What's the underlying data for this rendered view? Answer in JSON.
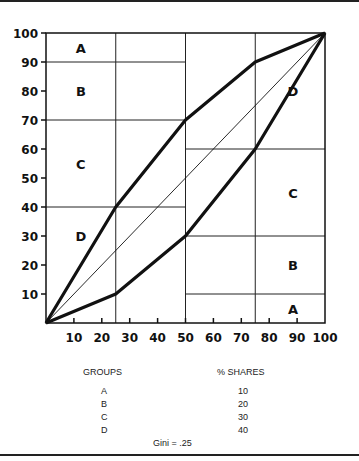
{
  "chart_data": {
    "type": "line",
    "title": "",
    "xlabel": "",
    "ylabel": "",
    "xlim": [
      0,
      100
    ],
    "ylim": [
      0,
      100
    ],
    "x_ticks": [
      "10",
      "20",
      "30",
      "40",
      "50",
      "60",
      "70",
      "80",
      "90",
      "100"
    ],
    "y_ticks": [
      "10",
      "20",
      "30",
      "40",
      "50",
      "60",
      "70",
      "80",
      "90",
      "100"
    ],
    "grid": {
      "x": [
        25,
        50,
        75
      ],
      "y_left": [
        40,
        70,
        90
      ],
      "y_right": [
        10,
        30,
        60
      ]
    },
    "series": [
      {
        "name": "upper-lorenz",
        "x": [
          0,
          25,
          50,
          75,
          100
        ],
        "y": [
          0,
          40,
          70,
          90,
          100
        ]
      },
      {
        "name": "equality-line",
        "x": [
          0,
          100
        ],
        "y": [
          0,
          100
        ]
      },
      {
        "name": "lower-lorenz",
        "x": [
          0,
          25,
          50,
          75,
          100
        ],
        "y": [
          0,
          10,
          30,
          60,
          100
        ]
      }
    ],
    "region_labels_left": [
      {
        "label": "A",
        "y": 95
      },
      {
        "label": "B",
        "y": 80
      },
      {
        "label": "C",
        "y": 55
      },
      {
        "label": "D",
        "y": 30
      }
    ],
    "region_labels_right": [
      {
        "label": "D",
        "y": 80
      },
      {
        "label": "C",
        "y": 45
      },
      {
        "label": "B",
        "y": 20
      },
      {
        "label": "A",
        "y": 5
      }
    ]
  },
  "table": {
    "headers": [
      "GROUPS",
      "% SHARES"
    ],
    "rows": [
      {
        "group": "A",
        "share": "10"
      },
      {
        "group": "B",
        "share": "20"
      },
      {
        "group": "C",
        "share": "30"
      },
      {
        "group": "D",
        "share": "40"
      }
    ],
    "gini": "Gini = .25"
  }
}
